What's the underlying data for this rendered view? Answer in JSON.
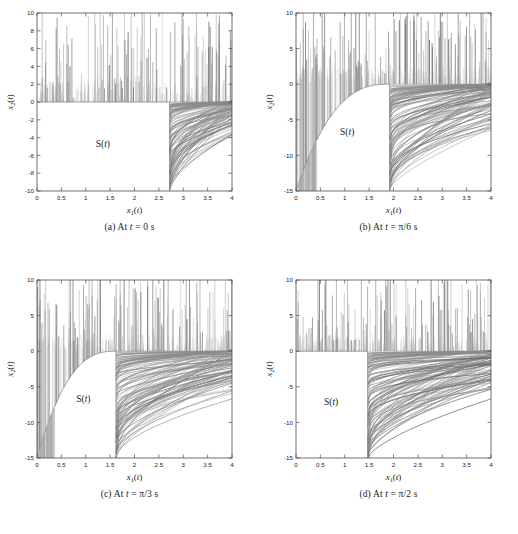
{
  "figure": {
    "panel_count": 4,
    "background": "#ffffff",
    "curve_color": "#808080",
    "axis_color": "#4d4d4d"
  },
  "panels": [
    {
      "key": "a",
      "caption_prefix": "(a)",
      "caption_text": "At t = 0 s",
      "caption_var": "t",
      "caption_value": "0",
      "caption_unit": "s",
      "region_label": "S(t)",
      "xlabel": "x₁(t)",
      "ylabel": "x₂(t)",
      "xlim": [
        0,
        4
      ],
      "ylim": [
        -10,
        10
      ],
      "xticks": [
        0,
        0.5,
        1,
        1.5,
        2,
        2.5,
        3,
        3.5,
        4
      ],
      "xticklabels": [
        "0",
        "0.5",
        "1",
        "1.5",
        "2",
        "2.5",
        "3",
        "3.5",
        "4"
      ],
      "yticks": [
        -10,
        -8,
        -6,
        -4,
        -2,
        0,
        2,
        4,
        6,
        8,
        10
      ],
      "yticklabels": [
        "-10",
        "-8",
        "-6",
        "-4",
        "-2",
        "0",
        "2",
        "4",
        "6",
        "8",
        "10"
      ],
      "boundary_x": 2.72,
      "boundary_type": "vertical-step",
      "boundary_curve_amplitude": 0.0,
      "region_label_pos": [
        1.35,
        -5.0
      ]
    },
    {
      "key": "b",
      "caption_prefix": "(b)",
      "caption_text": "At t = π/6 s",
      "caption_var": "t",
      "caption_value": "π/6",
      "caption_unit": "s",
      "region_label": "S(t)",
      "xlabel": "x₁(t)",
      "ylabel": "x₂(t)",
      "xlim": [
        0,
        4
      ],
      "ylim": [
        -15,
        10
      ],
      "xticks": [
        0,
        0.5,
        1,
        1.5,
        2,
        2.5,
        3,
        3.5,
        4
      ],
      "xticklabels": [
        "0",
        "0.5",
        "1",
        "1.5",
        "2",
        "2.5",
        "3",
        "3.5",
        "4"
      ],
      "yticks": [
        -15,
        -10,
        -5,
        0,
        5,
        10
      ],
      "yticklabels": [
        "-15",
        "-10",
        "-5",
        "0",
        "5",
        "10"
      ],
      "boundary_x": 1.92,
      "boundary_type": "concave-arc",
      "boundary_curve_amplitude": 1.6,
      "region_label_pos": [
        1.05,
        -7.2
      ]
    },
    {
      "key": "c",
      "caption_prefix": "(c)",
      "caption_text": "At t = π/3 s",
      "caption_var": "t",
      "caption_value": "π/3",
      "caption_unit": "s",
      "region_label": "S(t)",
      "xlabel": "x₁(t)",
      "ylabel": "x₂(t)",
      "xlim": [
        0,
        4
      ],
      "ylim": [
        -15,
        10
      ],
      "xticks": [
        0,
        0.5,
        1,
        1.5,
        2,
        2.5,
        3,
        3.5,
        4
      ],
      "xticklabels": [
        "0",
        "0.5",
        "1",
        "1.5",
        "2",
        "2.5",
        "3",
        "3.5",
        "4"
      ],
      "yticks": [
        -15,
        -10,
        -5,
        0,
        5,
        10
      ],
      "yticklabels": [
        "-15",
        "-10",
        "-5",
        "0",
        "5",
        "10"
      ],
      "boundary_x": 1.62,
      "boundary_type": "concave-arc",
      "boundary_curve_amplitude": 3.6,
      "region_label_pos": [
        0.95,
        -7.2
      ]
    },
    {
      "key": "d",
      "caption_prefix": "(d)",
      "caption_text": "At t = π/2 s",
      "caption_var": "t",
      "caption_value": "π/2",
      "caption_unit": "s",
      "region_label": "S(t)",
      "xlabel": "x₁(t)",
      "ylabel": "x₂(t)",
      "xlim": [
        0,
        4
      ],
      "ylim": [
        -15,
        10
      ],
      "xticks": [
        0,
        0.5,
        1,
        1.5,
        2,
        2.5,
        3,
        3.5,
        4
      ],
      "xticklabels": [
        "0",
        "0.5",
        "1",
        "1.5",
        "2",
        "2.5",
        "3",
        "3.5",
        "4"
      ],
      "yticks": [
        -15,
        -10,
        -5,
        0,
        5,
        10
      ],
      "yticklabels": [
        "-15",
        "-10",
        "-5",
        "0",
        "5",
        "10"
      ],
      "boundary_x": 1.47,
      "boundary_type": "vertical-step",
      "boundary_curve_amplitude": 0.0,
      "region_label_pos": [
        0.72,
        -7.6
      ]
    }
  ],
  "chart_data": [
    {
      "type": "line",
      "title": "(a) At t = 0 s",
      "xlabel": "x1(t)",
      "ylabel": "x2(t)",
      "xlim": [
        0,
        4
      ],
      "ylim": [
        -10,
        10
      ],
      "grid": false,
      "legend": null,
      "annotations": [
        {
          "text": "S(t)",
          "x": 1.35,
          "y": -5.0
        }
      ],
      "description": "Phase-plane reachable-set figure. Dense near-vertical trajectory spikes rise from x2=0 to the top of the frame for x1 in [0,4]; to the right of x1=2.72 a fan of rising hyperbolic curves fills the lower-right quadrant down to x2=-10. The unshaded region left of x1=2.72 and below x2=0 is the set S(t).",
      "boundary_x": 2.72,
      "spike_count": 120,
      "fan_curve_count": 70
    },
    {
      "type": "line",
      "title": "(b) At t = π/6 s",
      "xlabel": "x1(t)",
      "ylabel": "x2(t)",
      "xlim": [
        0,
        4
      ],
      "ylim": [
        -15,
        10
      ],
      "grid": false,
      "legend": null,
      "annotations": [
        {
          "text": "S(t)",
          "x": 1.05,
          "y": -7.2
        }
      ],
      "description": "Spikes rise from a concave boundary arc that descends from x2=-1 near x1=1.9 down to x2=-15 at x1=0.08. Right of x1=1.92 a fan of rising curves spans from x2=-15 up to x2=0.",
      "boundary_x": 1.92,
      "spike_count": 120,
      "fan_curve_count": 80
    },
    {
      "type": "line",
      "title": "(c) At t = π/3 s",
      "xlabel": "x1(t)",
      "ylabel": "x2(t)",
      "xlim": [
        0,
        4
      ],
      "ylim": [
        -15,
        10
      ],
      "grid": false,
      "legend": null,
      "annotations": [
        {
          "text": "S(t)",
          "x": 0.95,
          "y": -7.2
        }
      ],
      "description": "Same structure as (b) with the vertical boundary moved left to x1=1.62 and a deeper concave arc reaching x2=-15 near x1=0.12.",
      "boundary_x": 1.62,
      "spike_count": 130,
      "fan_curve_count": 90
    },
    {
      "type": "line",
      "title": "(d) At t = π/2 s",
      "xlabel": "x1(t)",
      "ylabel": "x2(t)",
      "xlim": [
        0,
        4
      ],
      "ylim": [
        -15,
        10
      ],
      "grid": false,
      "legend": null,
      "annotations": [
        {
          "text": "S(t)",
          "x": 0.72,
          "y": -7.6
        }
      ],
      "description": "Boundary is a clean vertical step at x1=1.47 with a flat top at x2=0; the rectangular unshaded set S(t) occupies x1 in [0,1.47], x2 in [-15,0]. A dense fan of rising curves fills the lower-right region.",
      "boundary_x": 1.47,
      "spike_count": 110,
      "fan_curve_count": 95
    }
  ]
}
